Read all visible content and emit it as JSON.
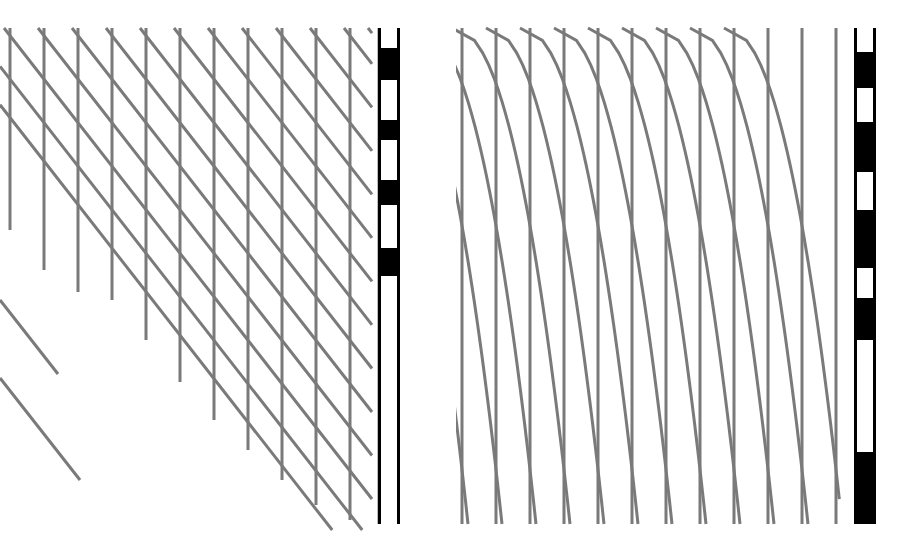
{
  "figure": {
    "background_color": "#ffffff",
    "line_color": "#7a7a7a",
    "bar_color": "#000000",
    "width": 912,
    "height": 551
  },
  "panels": [
    {
      "id": "panel-left",
      "name": "left-panel",
      "label": "",
      "x": 0,
      "y": 0,
      "width": 456,
      "height": 551,
      "description": "Vertical strokes truncated along a descending diagonal front, with straight diagonal strokes continuing below",
      "vertical_lines": {
        "count": 12,
        "x_positions": [
          10,
          44,
          78,
          112,
          146,
          180,
          214,
          248,
          282,
          316,
          350,
          379
        ],
        "top_y": 28,
        "stroke_width": 3,
        "bottom_y_values": [
          230,
          270,
          292,
          300,
          340,
          382,
          420,
          450,
          480,
          505,
          520,
          524
        ]
      },
      "diagonal_lines": {
        "count": 14,
        "angle_deg": 52,
        "stroke_width": 3,
        "start_points_x": [
          -60,
          -30,
          4,
          38,
          72,
          106,
          140,
          174,
          208,
          242,
          276,
          310,
          344,
          368
        ],
        "description": "Parallel straight strokes descending left-to-right at a constant slope"
      }
    },
    {
      "id": "panel-right",
      "name": "right-panel",
      "label": "",
      "x": 456,
      "y": 0,
      "width": 456,
      "height": 551,
      "description": "Full-height vertical lines overlaid with curved strokes that start steeply inclined at the top and bend toward vertical at the bottom",
      "vertical_lines": {
        "count": 12,
        "x_positions": [
          6,
          40,
          74,
          108,
          142,
          176,
          210,
          244,
          278,
          312,
          346,
          380
        ],
        "top_y": 28,
        "bottom_y": 524,
        "stroke_width": 3
      },
      "curved_lines": {
        "count": 13,
        "stroke_width": 3,
        "description": "Concave curves: steep diagonal near the top flattening into near-vertical descent at the bottom"
      }
    }
  ],
  "scale_bars": [
    {
      "id": "scale-bar-left",
      "name": "left-scale-bar",
      "x": 378,
      "y": 28,
      "width": 22,
      "height": 496,
      "orientation": "vertical",
      "frame_color": "#000000",
      "frame_width": 3,
      "segments": [
        {
          "color": "#ffffff",
          "start": 28,
          "end": 48
        },
        {
          "color": "#000000",
          "start": 48,
          "end": 80
        },
        {
          "color": "#ffffff",
          "start": 80,
          "end": 120
        },
        {
          "color": "#000000",
          "start": 120,
          "end": 140
        },
        {
          "color": "#ffffff",
          "start": 140,
          "end": 180
        },
        {
          "color": "#000000",
          "start": 180,
          "end": 205
        },
        {
          "color": "#ffffff",
          "start": 205,
          "end": 248
        },
        {
          "color": "#000000",
          "start": 248,
          "end": 276
        },
        {
          "color": "#ffffff",
          "start": 276,
          "end": 524
        }
      ]
    },
    {
      "id": "scale-bar-right",
      "name": "right-scale-bar",
      "x": 854,
      "y": 28,
      "width": 22,
      "height": 496,
      "orientation": "vertical",
      "frame_color": "#000000",
      "frame_width": 3,
      "segments": [
        {
          "color": "#ffffff",
          "start": 28,
          "end": 52
        },
        {
          "color": "#000000",
          "start": 52,
          "end": 88
        },
        {
          "color": "#ffffff",
          "start": 88,
          "end": 122
        },
        {
          "color": "#000000",
          "start": 122,
          "end": 172
        },
        {
          "color": "#ffffff",
          "start": 172,
          "end": 210
        },
        {
          "color": "#000000",
          "start": 210,
          "end": 268
        },
        {
          "color": "#ffffff",
          "start": 268,
          "end": 298
        },
        {
          "color": "#000000",
          "start": 298,
          "end": 340
        },
        {
          "color": "#ffffff",
          "start": 340,
          "end": 452
        },
        {
          "color": "#000000",
          "start": 452,
          "end": 524
        }
      ]
    }
  ]
}
